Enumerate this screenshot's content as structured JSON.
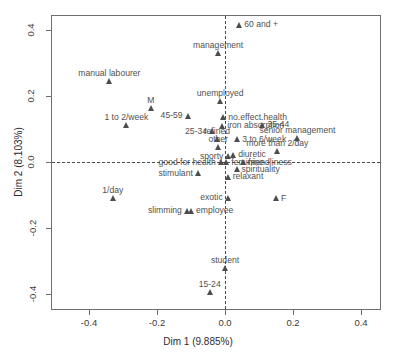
{
  "chart_data": {
    "type": "scatter",
    "title": "",
    "subtitle": "",
    "xlabel": "Dim 1 (9.885%)",
    "ylabel": "Dim 2 (8.103%)",
    "xlim": [
      -0.52,
      0.45
    ],
    "ylim": [
      -0.46,
      0.46
    ],
    "xticks": [
      -0.4,
      -0.2,
      0.0,
      0.2,
      0.4
    ],
    "xtick_labels": [
      "-0.4",
      "-0.2",
      "0.0",
      "0.2",
      "0.4"
    ],
    "yticks": [
      -0.4,
      -0.2,
      0.0,
      0.2,
      0.4
    ],
    "ytick_labels": [
      "-0.4",
      "-0.2",
      "0.0",
      "0.2",
      "0.4"
    ],
    "grid": false,
    "legend": "none",
    "reference_lines": {
      "horizontal": 0.0,
      "vertical": 0.0,
      "style": "dashed"
    },
    "marker": "filled-triangle",
    "marker_color": "#4d4d4d",
    "points": [
      {
        "label": "60 and +",
        "x": 0.042,
        "y": 0.414,
        "label_pos": "right"
      },
      {
        "label": "management",
        "x": -0.02,
        "y": 0.33,
        "label_pos": "above"
      },
      {
        "label": "manual labourer",
        "x": -0.34,
        "y": 0.245,
        "label_pos": "above"
      },
      {
        "label": "unemployed",
        "x": -0.014,
        "y": 0.185,
        "label_pos": "above"
      },
      {
        "label": "M",
        "x": -0.218,
        "y": 0.163,
        "label_pos": "above"
      },
      {
        "label": "45-59",
        "x": -0.11,
        "y": 0.14,
        "label_pos": "left"
      },
      {
        "label": "no.effect.health",
        "x": -0.005,
        "y": 0.135,
        "label_pos": "right"
      },
      {
        "label": "1 to 2/week",
        "x": -0.29,
        "y": 0.113,
        "label_pos": "above"
      },
      {
        "label": "iron absorption",
        "x": -0.008,
        "y": 0.11,
        "label_pos": "right"
      },
      {
        "label": "35-44",
        "x": 0.11,
        "y": 0.113,
        "label_pos": "right"
      },
      {
        "label": "25-34",
        "x": -0.038,
        "y": 0.093,
        "label_pos": "left"
      },
      {
        "label": "senior management",
        "x": 0.213,
        "y": 0.073,
        "label_pos": "above"
      },
      {
        "label": "refined",
        "x": -0.024,
        "y": 0.068,
        "label_pos": "above"
      },
      {
        "label": "3 to 6/week",
        "x": 0.036,
        "y": 0.068,
        "label_pos": "right"
      },
      {
        "label": "other",
        "x": -0.02,
        "y": 0.045,
        "label_pos": "above"
      },
      {
        "label": "more than 2/day",
        "x": 0.154,
        "y": 0.032,
        "label_pos": "above"
      },
      {
        "label": "diuretic",
        "x": 0.024,
        "y": 0.022,
        "label_pos": "right"
      },
      {
        "label": "sporty",
        "x": 0.01,
        "y": 0.018,
        "label_pos": "left"
      },
      {
        "label": "good for health",
        "x": -0.012,
        "y": 0.0,
        "label_pos": "left"
      },
      {
        "label": "feminine",
        "x": 0.004,
        "y": 0.0,
        "label_pos": "right"
      },
      {
        "label": "friendliness",
        "x": 0.054,
        "y": 0.0,
        "label_pos": "right"
      },
      {
        "label": "spirituality",
        "x": 0.034,
        "y": -0.022,
        "label_pos": "right"
      },
      {
        "label": "stimulant",
        "x": -0.08,
        "y": -0.034,
        "label_pos": "left"
      },
      {
        "label": "relaxant",
        "x": 0.008,
        "y": -0.045,
        "label_pos": "right"
      },
      {
        "label": "F",
        "x": 0.15,
        "y": -0.11,
        "label_pos": "right"
      },
      {
        "label": "1/day",
        "x": -0.33,
        "y": -0.108,
        "label_pos": "above"
      },
      {
        "label": "exotic",
        "x": 0.008,
        "y": -0.108,
        "label_pos": "left"
      },
      {
        "label": "slimming",
        "x": -0.112,
        "y": -0.148,
        "label_pos": "left"
      },
      {
        "label": "employee",
        "x": -0.1,
        "y": -0.148,
        "label_pos": "right"
      },
      {
        "label": "student",
        "x": 0.0,
        "y": -0.32,
        "label_pos": "above"
      },
      {
        "label": "15-24",
        "x": -0.045,
        "y": -0.394,
        "label_pos": "above"
      }
    ]
  }
}
